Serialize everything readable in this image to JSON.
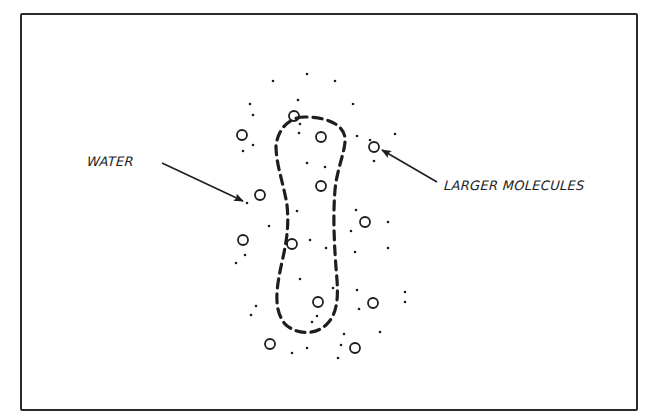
{
  "figure": {
    "labels": {
      "water": "WATER",
      "larger_molecules": "LARGER MOLECULES"
    },
    "colors": {
      "ink": "#1e1e1e",
      "background": "#ffffff",
      "frame": "#2a2a2a"
    },
    "membrane_path": "M 305 117 C 290 117 278 128 276 146 C 276 165 284 185 287 205 C 289 225 287 240 282 262 C 277 285 272 310 286 325 C 298 335 315 335 326 325 C 340 312 338 290 336 268 C 334 240 333 215 335 190 C 337 168 346 150 345 138 C 343 122 322 117 305 117 Z",
    "larger_molecules": [
      {
        "x": 242,
        "y": 135
      },
      {
        "x": 294,
        "y": 116
      },
      {
        "x": 321,
        "y": 137
      },
      {
        "x": 374,
        "y": 147
      },
      {
        "x": 321,
        "y": 186
      },
      {
        "x": 260,
        "y": 195
      },
      {
        "x": 243,
        "y": 240
      },
      {
        "x": 292,
        "y": 244
      },
      {
        "x": 365,
        "y": 222
      },
      {
        "x": 318,
        "y": 302
      },
      {
        "x": 373,
        "y": 303
      },
      {
        "x": 270,
        "y": 344
      },
      {
        "x": 355,
        "y": 348
      }
    ],
    "water_molecules": [
      {
        "x": 273,
        "y": 81
      },
      {
        "x": 307,
        "y": 74
      },
      {
        "x": 335,
        "y": 81
      },
      {
        "x": 250,
        "y": 104
      },
      {
        "x": 298,
        "y": 100
      },
      {
        "x": 353,
        "y": 104
      },
      {
        "x": 253,
        "y": 145
      },
      {
        "x": 370,
        "y": 140
      },
      {
        "x": 253,
        "y": 115
      },
      {
        "x": 300,
        "y": 124
      },
      {
        "x": 299,
        "y": 133
      },
      {
        "x": 243,
        "y": 151
      },
      {
        "x": 357,
        "y": 136
      },
      {
        "x": 395,
        "y": 134
      },
      {
        "x": 307,
        "y": 163
      },
      {
        "x": 325,
        "y": 167
      },
      {
        "x": 374,
        "y": 161
      },
      {
        "x": 247,
        "y": 203
      },
      {
        "x": 297,
        "y": 211
      },
      {
        "x": 269,
        "y": 226
      },
      {
        "x": 310,
        "y": 240
      },
      {
        "x": 326,
        "y": 248
      },
      {
        "x": 356,
        "y": 210
      },
      {
        "x": 351,
        "y": 231
      },
      {
        "x": 355,
        "y": 252
      },
      {
        "x": 388,
        "y": 222
      },
      {
        "x": 388,
        "y": 248
      },
      {
        "x": 245,
        "y": 255
      },
      {
        "x": 236,
        "y": 263
      },
      {
        "x": 300,
        "y": 279
      },
      {
        "x": 333,
        "y": 288
      },
      {
        "x": 357,
        "y": 290
      },
      {
        "x": 405,
        "y": 292
      },
      {
        "x": 405,
        "y": 302
      },
      {
        "x": 256,
        "y": 306
      },
      {
        "x": 251,
        "y": 315
      },
      {
        "x": 359,
        "y": 309
      },
      {
        "x": 317,
        "y": 316
      },
      {
        "x": 312,
        "y": 322
      },
      {
        "x": 344,
        "y": 334
      },
      {
        "x": 380,
        "y": 332
      },
      {
        "x": 307,
        "y": 348
      },
      {
        "x": 292,
        "y": 353
      },
      {
        "x": 341,
        "y": 345
      },
      {
        "x": 338,
        "y": 358
      }
    ],
    "arrows": {
      "water": {
        "x1": 162,
        "y1": 163,
        "x2": 243,
        "y2": 201
      },
      "larger_molecules": {
        "x1": 437,
        "y1": 182,
        "x2": 382,
        "y2": 150
      }
    }
  }
}
